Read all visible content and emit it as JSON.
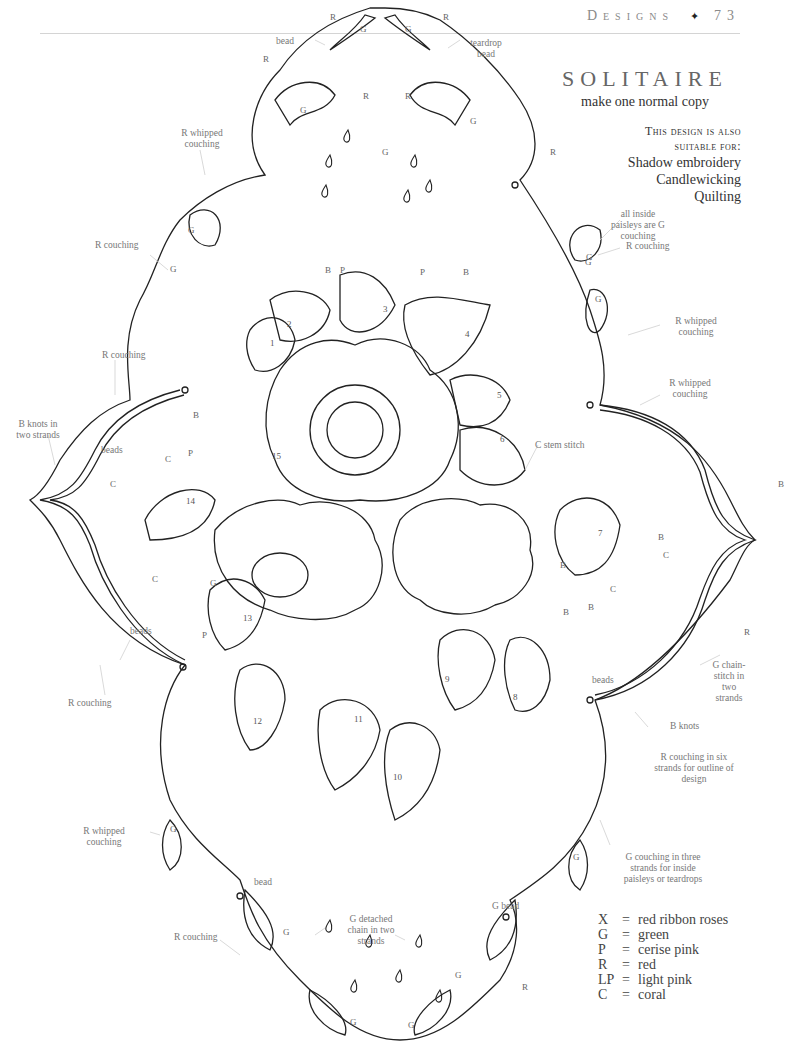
{
  "running_head": {
    "section": "Designs",
    "separator": "✦",
    "page_number": "73"
  },
  "design": {
    "title": "SOLITAIRE",
    "subtitle": "make one normal copy",
    "suitable_heading_1": "This design is also",
    "suitable_heading_2": "suitable for:",
    "suitable_for": [
      "Shadow embroidery",
      "Candlewicking",
      "Quilting"
    ]
  },
  "annotations": {
    "bead_top": "bead",
    "teardrop_bead": "teardrop bead",
    "r_whipped_couching_top_left": "R whipped couching",
    "r_couching_left_upper": "R couching",
    "all_inside_paisleys": "all inside paisleys are G couching",
    "r_couching_right_upper": "R couching",
    "r_whipped_couching_right_1": "R whipped couching",
    "r_whipped_couching_right_2": "R whipped couching",
    "r_couching_left_mid": "R couching",
    "b_knots_two_strands": "B knots in two strands",
    "beads_left_upper": "beads",
    "c_stem_stitch": "C stem stitch",
    "beads_left_lower": "beads",
    "r_couching_left_lower": "R couching",
    "g_chain_stitch": "G chain-stitch in two strands",
    "beads_right": "beads",
    "b_knots": "B knots",
    "r_couching_six_strands": "R couching in six strands for outline of design",
    "g_couching_three_strands": "G couching in three strands for inside paisleys or teardrops",
    "r_whipped_couching_bottom_left": "R whipped couching",
    "bead_bottom_left": "bead",
    "r_couching_bottom": "R couching",
    "g_detached_chain": "G detached chain in two strands",
    "g_bead": "G bead",
    "leaf_numbers": [
      "1",
      "2",
      "3",
      "4",
      "5",
      "6",
      "7",
      "8",
      "9",
      "10",
      "11",
      "12",
      "13",
      "14"
    ]
  },
  "legend": [
    {
      "key": "X",
      "value": "red ribbon roses"
    },
    {
      "key": "G",
      "value": "green"
    },
    {
      "key": "P",
      "value": "cerise pink"
    },
    {
      "key": "R",
      "value": "red"
    },
    {
      "key": "LP",
      "value": "light pink"
    },
    {
      "key": "C",
      "value": "coral"
    }
  ]
}
